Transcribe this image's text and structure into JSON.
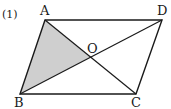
{
  "problem_number": "(1)",
  "figure": {
    "type": "parallelogram",
    "vertices": {
      "A": {
        "label": "A",
        "x": 45,
        "y": 20
      },
      "D": {
        "label": "D",
        "x": 162,
        "y": 20
      },
      "B": {
        "label": "B",
        "x": 20,
        "y": 94
      },
      "C": {
        "label": "C",
        "x": 136,
        "y": 94
      },
      "O": {
        "label": "O",
        "x": 91,
        "y": 57
      }
    },
    "diagonals": [
      "AC",
      "BD"
    ],
    "shaded_region": "triangle ABO",
    "colors": {
      "stroke": "#1a1a1a",
      "shade": "#cfcfcf"
    }
  }
}
